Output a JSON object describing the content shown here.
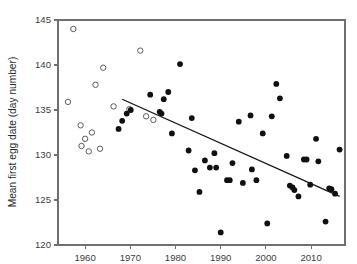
{
  "chart_data": {
    "type": "scatter",
    "title": "",
    "xlabel": "",
    "ylabel": "Mean first egg date (day number)",
    "xlim": [
      1954,
      2017.5
    ],
    "ylim": [
      120,
      145
    ],
    "xticks": [
      1960,
      1970,
      1980,
      1990,
      2000,
      2010
    ],
    "yticks": [
      120,
      125,
      130,
      135,
      140,
      145
    ],
    "xtick_labels": [
      "1960",
      "1970",
      "1980",
      "1990",
      "2000",
      "2010"
    ],
    "ytick_labels": [
      "120",
      "125",
      "130",
      "135",
      "140",
      "145"
    ],
    "grid": false,
    "legend": "none",
    "series": [
      {
        "name": "Historical (open circles)",
        "marker": "open-circle",
        "marker_color": "#ffffff",
        "marker_edge_color": "#5a5a5a",
        "points": [
          {
            "x": 1956.2,
            "y": 135.9
          },
          {
            "x": 1957.4,
            "y": 144.0
          },
          {
            "x": 1959.0,
            "y": 133.3
          },
          {
            "x": 1959.2,
            "y": 131.0
          },
          {
            "x": 1960.0,
            "y": 131.8
          },
          {
            "x": 1960.8,
            "y": 130.4
          },
          {
            "x": 1961.5,
            "y": 132.5
          },
          {
            "x": 1962.3,
            "y": 137.8
          },
          {
            "x": 1963.3,
            "y": 130.7
          },
          {
            "x": 1964.0,
            "y": 139.7
          },
          {
            "x": 1966.3,
            "y": 135.4
          },
          {
            "x": 1969.8,
            "y": 135.1
          },
          {
            "x": 1972.2,
            "y": 141.6
          },
          {
            "x": 1973.5,
            "y": 134.3
          },
          {
            "x": 1975.1,
            "y": 133.9
          }
        ]
      },
      {
        "name": "Recent (filled circles)",
        "marker": "filled-circle",
        "marker_color": "#101010",
        "marker_edge_color": "#101010",
        "points": [
          {
            "x": 1967.4,
            "y": 132.9
          },
          {
            "x": 1968.2,
            "y": 133.8
          },
          {
            "x": 1969.2,
            "y": 134.6
          },
          {
            "x": 1970.1,
            "y": 135.0
          },
          {
            "x": 1974.4,
            "y": 136.7
          },
          {
            "x": 1976.5,
            "y": 134.8
          },
          {
            "x": 1976.9,
            "y": 134.6
          },
          {
            "x": 1977.4,
            "y": 136.2
          },
          {
            "x": 1978.4,
            "y": 137.0
          },
          {
            "x": 1979.2,
            "y": 132.4
          },
          {
            "x": 1981.0,
            "y": 140.1
          },
          {
            "x": 1982.9,
            "y": 130.5
          },
          {
            "x": 1983.6,
            "y": 134.1
          },
          {
            "x": 1984.3,
            "y": 128.3
          },
          {
            "x": 1985.3,
            "y": 125.9
          },
          {
            "x": 1986.5,
            "y": 129.4
          },
          {
            "x": 1987.6,
            "y": 128.6
          },
          {
            "x": 1988.6,
            "y": 130.2
          },
          {
            "x": 1989.0,
            "y": 128.6
          },
          {
            "x": 1990.0,
            "y": 121.4
          },
          {
            "x": 1991.4,
            "y": 127.2
          },
          {
            "x": 1992.0,
            "y": 127.2
          },
          {
            "x": 1992.6,
            "y": 129.1
          },
          {
            "x": 1994.0,
            "y": 133.7
          },
          {
            "x": 1994.9,
            "y": 126.9
          },
          {
            "x": 1996.6,
            "y": 134.4
          },
          {
            "x": 1996.9,
            "y": 128.4
          },
          {
            "x": 1997.9,
            "y": 127.2
          },
          {
            "x": 1999.3,
            "y": 132.4
          },
          {
            "x": 2000.3,
            "y": 122.4
          },
          {
            "x": 2001.3,
            "y": 134.3
          },
          {
            "x": 2002.3,
            "y": 137.9
          },
          {
            "x": 2003.1,
            "y": 136.3
          },
          {
            "x": 2004.6,
            "y": 129.9
          },
          {
            "x": 2005.3,
            "y": 126.6
          },
          {
            "x": 2005.9,
            "y": 126.4
          },
          {
            "x": 2006.3,
            "y": 126.1
          },
          {
            "x": 2007.2,
            "y": 125.4
          },
          {
            "x": 2008.4,
            "y": 129.5
          },
          {
            "x": 2009.0,
            "y": 129.5
          },
          {
            "x": 2009.8,
            "y": 126.7
          },
          {
            "x": 2011.1,
            "y": 131.8
          },
          {
            "x": 2011.6,
            "y": 129.3
          },
          {
            "x": 2013.2,
            "y": 122.6
          },
          {
            "x": 2014.0,
            "y": 126.3
          },
          {
            "x": 2014.5,
            "y": 126.2
          },
          {
            "x": 2015.3,
            "y": 125.7
          },
          {
            "x": 2016.3,
            "y": 130.6
          }
        ]
      }
    ],
    "trend_line": {
      "name": "regression-line",
      "color": "#141414",
      "x_start": 1968.2,
      "y_start": 136.2,
      "x_end": 2016.3,
      "y_end": 125.4
    }
  }
}
